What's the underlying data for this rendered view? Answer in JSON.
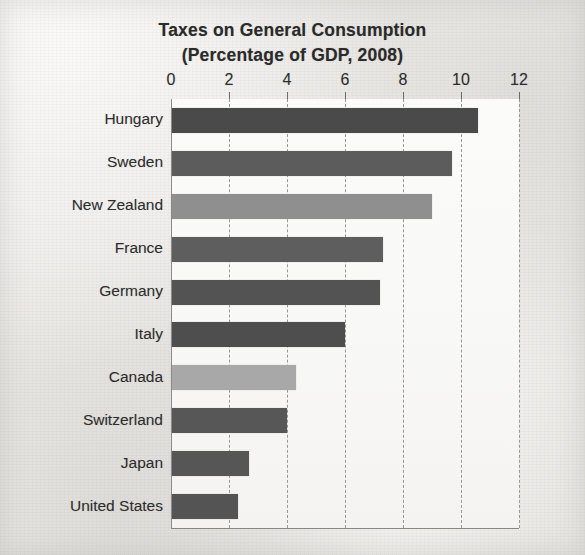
{
  "chart_data": {
    "type": "bar",
    "orientation": "horizontal",
    "title": "Taxes on General Consumption",
    "subtitle": "(Percentage of GDP, 2008)",
    "xlabel": "",
    "ylabel": "",
    "xlim": [
      0,
      12
    ],
    "xticks": [
      0,
      2,
      4,
      6,
      8,
      10,
      12
    ],
    "xtick_labels": [
      "0",
      "2",
      "4",
      "6",
      "8",
      "10",
      "12"
    ],
    "grid": "vertical-dashed",
    "legend": "none",
    "categories": [
      "Hungary",
      "Sweden",
      "New Zealand",
      "France",
      "Germany",
      "Italy",
      "Canada",
      "Switzerland",
      "Japan",
      "United States"
    ],
    "values": [
      10.6,
      9.7,
      9.0,
      7.3,
      7.2,
      6.0,
      4.3,
      4.0,
      2.7,
      2.3
    ],
    "bar_colors": [
      "#4a4a4a",
      "#5c5c5c",
      "#8f8f8f",
      "#5e5e5e",
      "#535353",
      "#4e4e4e",
      "#a8a8a8",
      "#575757",
      "#565656",
      "#545454"
    ],
    "plot_background": "#faf9f8",
    "page_background": "#ecebe8",
    "axis_color": "#8d8b89",
    "gridline_color": "#9b9997",
    "text_color": "#2d2d2d"
  },
  "figure": {
    "caption_ghost": ""
  }
}
